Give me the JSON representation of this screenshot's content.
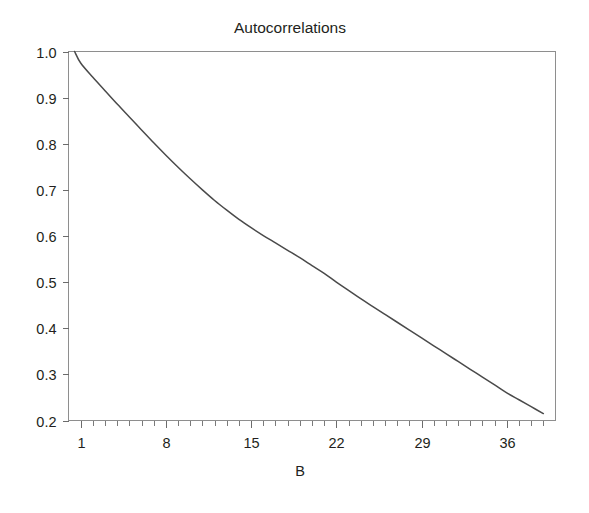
{
  "chart_data": {
    "type": "line",
    "title": "Autocorrelations",
    "xlabel": "B",
    "ylabel": "",
    "xlim": [
      0,
      40
    ],
    "ylim": [
      0.2,
      1.0
    ],
    "grid": false,
    "legend": null,
    "x_tick_labels": [
      "1",
      "8",
      "15",
      "22",
      "29",
      "36"
    ],
    "x_tick_values": [
      1,
      8,
      15,
      22,
      29,
      36
    ],
    "x_minor_tick_step": 1,
    "y_tick_labels": [
      "1.0",
      "0.9",
      "0.8",
      "0.7",
      "0.6",
      "0.5",
      "0.4",
      "0.3",
      "0.2"
    ],
    "y_tick_values": [
      1.0,
      0.9,
      0.8,
      0.7,
      0.6,
      0.5,
      0.4,
      0.3,
      0.2
    ],
    "series": [
      {
        "name": "autocorrelation",
        "color": "#4a4a4a",
        "x": [
          0.5,
          1,
          2,
          3,
          4,
          5,
          6,
          7,
          8,
          9,
          10,
          11,
          12,
          13,
          14,
          15,
          16,
          17,
          18,
          19,
          20,
          21,
          22,
          23,
          24,
          25,
          26,
          27,
          28,
          29,
          30,
          31,
          32,
          33,
          34,
          35,
          36,
          37,
          38,
          39
        ],
        "values": [
          1.0,
          0.975,
          0.944,
          0.915,
          0.886,
          0.858,
          0.83,
          0.802,
          0.775,
          0.749,
          0.724,
          0.7,
          0.677,
          0.656,
          0.636,
          0.618,
          0.601,
          0.585,
          0.569,
          0.553,
          0.536,
          0.519,
          0.5,
          0.482,
          0.464,
          0.447,
          0.43,
          0.413,
          0.396,
          0.379,
          0.362,
          0.345,
          0.328,
          0.311,
          0.294,
          0.277,
          0.26,
          0.245,
          0.23,
          0.215
        ]
      }
    ]
  },
  "figure": {
    "title": "Autocorrelations",
    "xaxis_label": "B",
    "frame_color": "#8e8e8e",
    "line_color": "#4a4a4a",
    "background": "#ffffff"
  }
}
